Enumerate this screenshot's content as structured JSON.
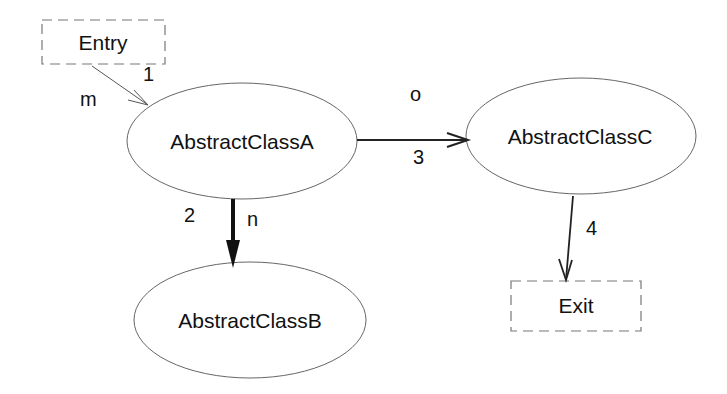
{
  "diagram": {
    "nodes": [
      {
        "id": "entry",
        "label": "Entry",
        "shape": "dashed-rect",
        "x": 42,
        "y": 20,
        "w": 123,
        "h": 44
      },
      {
        "id": "classA",
        "label": "AbstractClassA",
        "shape": "ellipse",
        "cx": 242,
        "cy": 141,
        "rx": 115,
        "ry": 58
      },
      {
        "id": "classB",
        "label": "AbstractClassB",
        "shape": "ellipse",
        "cx": 250,
        "cy": 320,
        "rx": 116,
        "ry": 58
      },
      {
        "id": "classC",
        "label": "AbstractClassC",
        "shape": "ellipse",
        "cx": 581,
        "cy": 136,
        "rx": 115,
        "ry": 58
      },
      {
        "id": "exit",
        "label": "Exit",
        "shape": "dashed-rect",
        "x": 511,
        "y": 281,
        "w": 130,
        "h": 50
      }
    ],
    "edges": [
      {
        "id": "e1",
        "from": "Entry",
        "to": "AbstractClassA",
        "number": "1",
        "label": "m",
        "style": "thin"
      },
      {
        "id": "e2",
        "from": "AbstractClassA",
        "to": "AbstractClassB",
        "number": "2",
        "label": "n",
        "style": "bold"
      },
      {
        "id": "e3",
        "from": "AbstractClassA",
        "to": "AbstractClassC",
        "number": "3",
        "label": "o",
        "style": "medium"
      },
      {
        "id": "e4",
        "from": "AbstractClassC",
        "to": "Exit",
        "number": "4",
        "label": "",
        "style": "medium"
      }
    ]
  }
}
